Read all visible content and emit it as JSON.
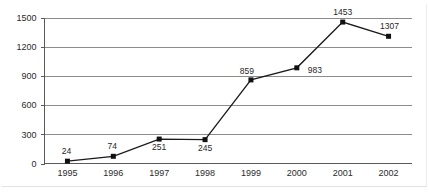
{
  "chart_data": {
    "type": "line",
    "title": "",
    "subtitle": "",
    "xlabel": "",
    "ylabel": "",
    "categories": [
      "1995",
      "1996",
      "1997",
      "1998",
      "1999",
      "2000",
      "2001",
      "2002"
    ],
    "values": [
      24,
      74,
      251,
      245,
      859,
      983,
      1453,
      1307
    ],
    "point_labels": [
      "24",
      "74",
      "251",
      "245",
      "859",
      "983",
      "1453",
      "1307"
    ],
    "ylim": [
      0,
      1500
    ],
    "yticks": [
      0,
      300,
      600,
      900,
      1200,
      1500
    ],
    "ytick_labels": [
      "0",
      "300",
      "600",
      "900",
      "1200",
      "1500"
    ],
    "grid": true,
    "grid_axis": "y",
    "legend": false,
    "legend_position": "none",
    "marker": "square",
    "colors": {
      "line": "#1a1a1a",
      "marker": "#111111",
      "grid": "#8c8c8c",
      "axis": "#5a5a5a",
      "text": "#2b2b2b",
      "background": "#ffffff"
    }
  }
}
